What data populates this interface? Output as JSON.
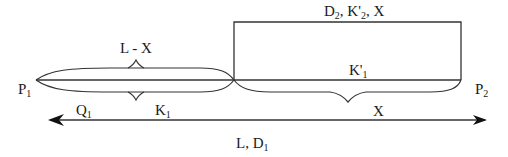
{
  "diagram": {
    "labels": {
      "p1": {
        "main": "P",
        "sub": "1"
      },
      "p2": {
        "main": "P",
        "sub": "2"
      },
      "l_minus_x": "L - X",
      "rect_top": {
        "d": "D",
        "d_sub": "2",
        "sep1": ", ",
        "k": "K'",
        "k_sub": "2",
        "sep2": ", ",
        "x": "X"
      },
      "k_prime_1": {
        "main": "K'",
        "sub": "1"
      },
      "q1": {
        "main": "Q",
        "sub": "1"
      },
      "k1": {
        "main": "K",
        "sub": "1"
      },
      "x_arrow": "X",
      "l_d1": {
        "prefix": "L, D",
        "sub": "1"
      }
    },
    "colors": {
      "stroke": "#333333",
      "text": "#1a1a1a",
      "background": "#ffffff"
    }
  }
}
